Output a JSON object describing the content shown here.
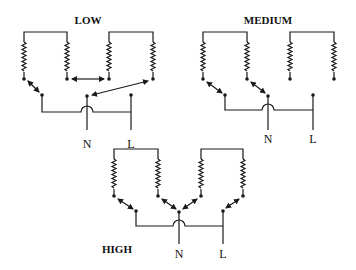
{
  "diagram": {
    "panels": [
      {
        "id": "low",
        "title": "LOW",
        "neutral_label": "N",
        "line_label": "L"
      },
      {
        "id": "medium",
        "title": "MEDIUM",
        "neutral_label": "N",
        "line_label": "L"
      },
      {
        "id": "high",
        "title": "HIGH",
        "neutral_label": "N",
        "line_label": "L"
      }
    ],
    "colors": {
      "line": "#1a1a1a",
      "background": "#ffffff"
    }
  }
}
